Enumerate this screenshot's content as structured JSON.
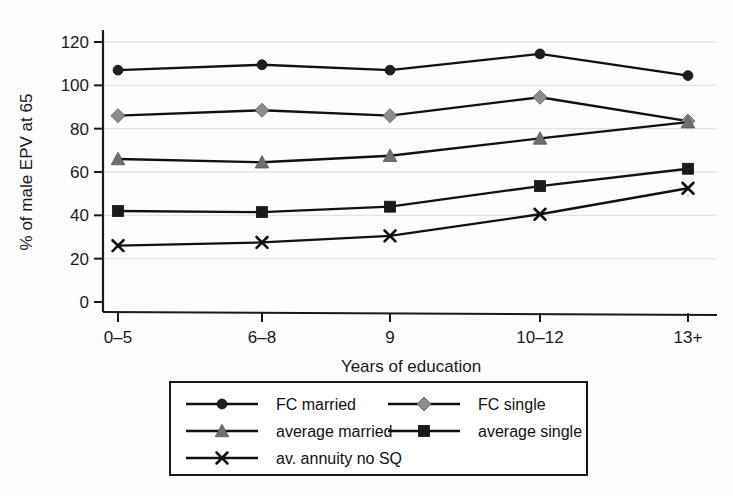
{
  "chart_data": {
    "type": "line",
    "title": "",
    "xlabel": "Years of education",
    "ylabel": "% of male EPV at 65",
    "categories": [
      "0–5",
      "6–8",
      "9",
      "10–12",
      "13+"
    ],
    "ylim": [
      0,
      120
    ],
    "yticks": [
      0,
      20,
      40,
      60,
      80,
      100,
      120
    ],
    "grid": "horizontal",
    "legend_position": "below-plot",
    "series": [
      {
        "name": "FC married",
        "values": [
          107,
          109.5,
          107,
          114.5,
          104.5
        ],
        "marker": "circle",
        "color": "#1f1f1f",
        "line_color": "#111111"
      },
      {
        "name": "FC single",
        "values": [
          86,
          88.5,
          86,
          94.5,
          83.5
        ],
        "marker": "diamond",
        "color": "#8d8d8d",
        "line_color": "#111111"
      },
      {
        "name": "average married",
        "values": [
          66,
          64.5,
          67.5,
          75.5,
          83
        ],
        "marker": "triangle",
        "color": "#6f6f6f",
        "line_color": "#111111"
      },
      {
        "name": "average single",
        "values": [
          42,
          41.5,
          44,
          53.5,
          61.5
        ],
        "marker": "square",
        "color": "#1a1a1a",
        "line_color": "#111111"
      },
      {
        "name": "av. annuity no SQ",
        "values": [
          26,
          27.5,
          30.5,
          40.5,
          52.5
        ],
        "marker": "cross",
        "color": "#111111",
        "line_color": "#111111"
      }
    ]
  },
  "legend": {
    "entries": [
      {
        "label": "FC married"
      },
      {
        "label": "FC single"
      },
      {
        "label": "average married"
      },
      {
        "label": "average single"
      },
      {
        "label": "av. annuity no SQ"
      }
    ]
  },
  "colors": {
    "background": "#fdfdfd",
    "grid": "#e3e3e3",
    "axis": "#1a1a1a",
    "legend_border": "#1a1a1a"
  }
}
